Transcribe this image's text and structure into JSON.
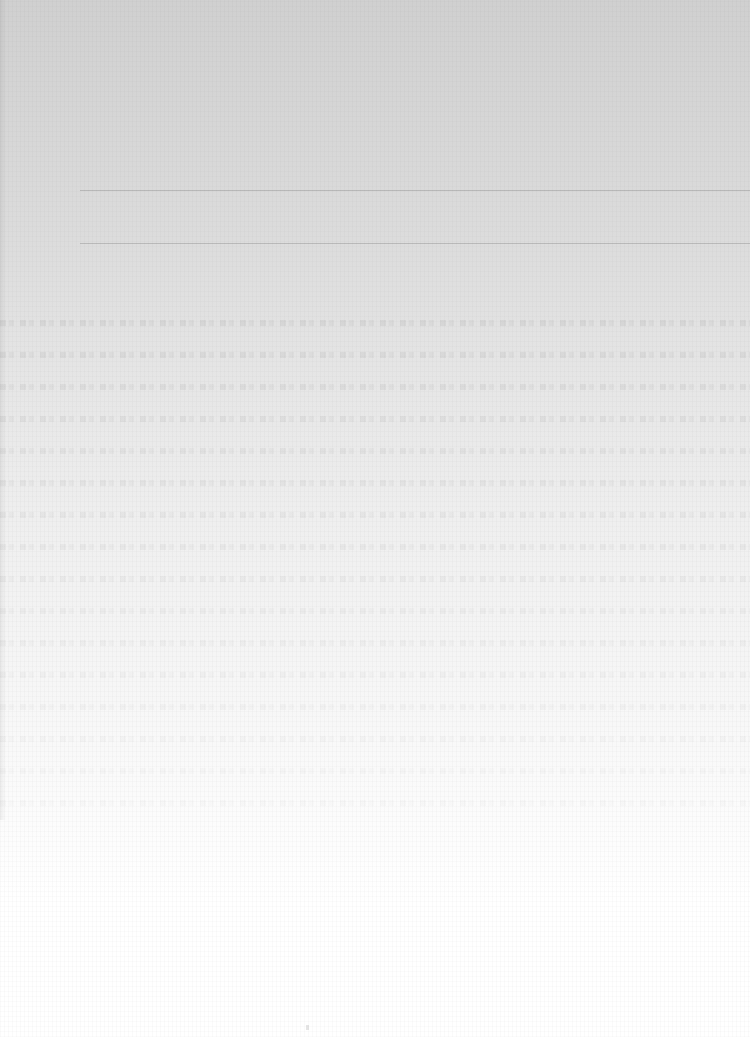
{
  "document": {
    "type": "scanned-paper-page",
    "legible_text": "",
    "background_gradient": {
      "top_color": "#d0d0d0",
      "bottom_color": "#ffffff"
    },
    "rules": [
      {
        "y": 190,
        "x_start": 80,
        "color": "#787878"
      },
      {
        "y": 243,
        "x_start": 80,
        "color": "#787878"
      }
    ],
    "bleed_through_band_ys": [
      320,
      352,
      384,
      416,
      448,
      480,
      512,
      544,
      576,
      608,
      640,
      672,
      704,
      736,
      768,
      800
    ]
  }
}
